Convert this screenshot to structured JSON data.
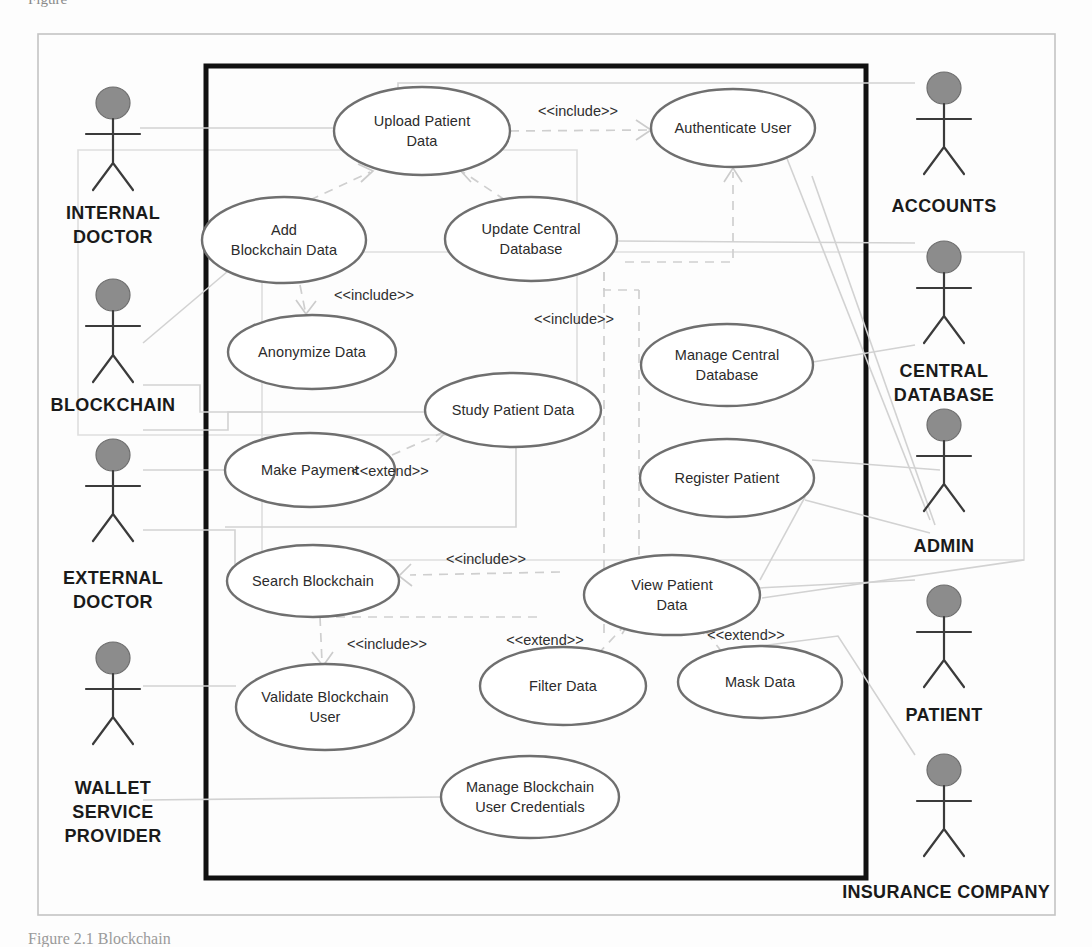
{
  "figure": {
    "caption_top_fragment": "Figure",
    "caption_bottom_fragment": "Figure 2.1 Blockchain",
    "system_boundary_label": "INSURANCE COMPANY"
  },
  "actors": [
    {
      "id": "internal-doctor",
      "label": "INTERNAL\nDOCTOR",
      "line1": "INTERNAL",
      "line2": "DOCTOR",
      "x": 113,
      "y": 118,
      "label_y": 218
    },
    {
      "id": "blockchain",
      "label": "BLOCKCHAIN",
      "line1": "BLOCKCHAIN",
      "line2": "",
      "x": 113,
      "y": 310,
      "label_y": 406
    },
    {
      "id": "external-doctor",
      "label": "EXTERNAL\nDOCTOR",
      "line1": "EXTERNAL",
      "line2": "DOCTOR",
      "x": 113,
      "y": 452,
      "label_y": 583
    },
    {
      "id": "wallet-service-provider",
      "label": "WALLET\nSERVICE\nPROVIDER",
      "line1": "WALLET",
      "line2": "SERVICE",
      "line3": "PROVIDER",
      "x": 113,
      "y": 673,
      "label_y": 794
    },
    {
      "id": "accounts",
      "label": "ACCOUNTS",
      "line1": "ACCOUNTS",
      "line2": "",
      "x": 944,
      "y": 90,
      "label_y": 183
    },
    {
      "id": "central-database",
      "label": "CENTRAL\nDATABASE",
      "line1": "CENTRAL",
      "line2": "DATABASE",
      "x": 944,
      "y": 258,
      "label_y": 355
    },
    {
      "id": "admin",
      "label": "ADMIN",
      "line1": "ADMIN",
      "line2": "",
      "x": 944,
      "y": 424,
      "label_y": 547
    },
    {
      "id": "patient",
      "label": "PATIENT",
      "line1": "PATIENT",
      "line2": "",
      "x": 944,
      "y": 607,
      "label_y": 712
    },
    {
      "id": "insurance-company-actor",
      "label": "",
      "line1": "",
      "line2": "",
      "x": 944,
      "y": 775,
      "label_y": 0
    }
  ],
  "use_cases": [
    {
      "id": "upload-patient-data",
      "line1": "Upload Patient",
      "line2": "Data",
      "cx": 422,
      "cy": 131,
      "rx": 88,
      "ry": 44
    },
    {
      "id": "authenticate-user",
      "line1": "Authenticate User",
      "line2": "",
      "cx": 733,
      "cy": 128,
      "rx": 82,
      "ry": 39
    },
    {
      "id": "add-blockchain-data",
      "line1": "Add",
      "line2": "Blockchain Data",
      "cx": 284,
      "cy": 240,
      "rx": 82,
      "ry": 43
    },
    {
      "id": "update-central-database",
      "line1": "Update Central",
      "line2": "Database",
      "cx": 531,
      "cy": 239,
      "rx": 86,
      "ry": 42
    },
    {
      "id": "anonymize-data",
      "line1": "Anonymize Data",
      "line2": "",
      "cx": 312,
      "cy": 352,
      "rx": 84,
      "ry": 37
    },
    {
      "id": "manage-central-database",
      "line1": "Manage Central",
      "line2": "Database",
      "cx": 727,
      "cy": 365,
      "rx": 86,
      "ry": 41
    },
    {
      "id": "study-patient-data",
      "line1": "Study Patient Data",
      "line2": "",
      "cx": 513,
      "cy": 410,
      "rx": 88,
      "ry": 37
    },
    {
      "id": "make-payment",
      "line1": "Make Payment",
      "line2": "",
      "cx": 310,
      "cy": 470,
      "rx": 85,
      "ry": 37
    },
    {
      "id": "register-patient",
      "line1": "Register Patient",
      "line2": "",
      "cx": 727,
      "cy": 478,
      "rx": 87,
      "ry": 39
    },
    {
      "id": "search-blockchain",
      "line1": "Search Blockchain",
      "line2": "",
      "cx": 313,
      "cy": 581,
      "rx": 86,
      "ry": 36
    },
    {
      "id": "view-patient-data",
      "line1": "View Patient",
      "line2": "Data",
      "cx": 672,
      "cy": 595,
      "rx": 88,
      "ry": 40
    },
    {
      "id": "validate-blockchain-user",
      "line1": "Validate Blockchain",
      "line2": "User",
      "cx": 325,
      "cy": 707,
      "rx": 89,
      "ry": 43
    },
    {
      "id": "filter-data",
      "line1": "Filter Data",
      "line2": "",
      "cx": 563,
      "cy": 686,
      "rx": 83,
      "ry": 39
    },
    {
      "id": "mask-data",
      "line1": "Mask Data",
      "line2": "",
      "cx": 760,
      "cy": 682,
      "rx": 82,
      "ry": 36
    },
    {
      "id": "manage-blockchain-user-credentials",
      "line1": "Manage Blockchain",
      "line2": "User Credentials",
      "cx": 530,
      "cy": 797,
      "rx": 89,
      "ry": 41
    }
  ],
  "stereotypes": [
    {
      "id": "include-upload-auth",
      "text": "<<include>>",
      "x": 578,
      "y": 112
    },
    {
      "id": "include-add-anonymize",
      "text": "<<include>>",
      "x": 374,
      "y": 296
    },
    {
      "id": "include-update-auth",
      "text": "<<include>>",
      "x": 574,
      "y": 320
    },
    {
      "id": "extend-make-study",
      "text": "<<extend>>",
      "x": 390,
      "y": 472
    },
    {
      "id": "include-search-study",
      "text": "<<include>>",
      "x": 486,
      "y": 560
    },
    {
      "id": "include-validate-search",
      "text": "<<include>>",
      "x": 387,
      "y": 645
    },
    {
      "id": "extend-filter-view",
      "text": "<<extend>>",
      "x": 545,
      "y": 641
    },
    {
      "id": "extend-mask-view",
      "text": "<<extend>>",
      "x": 746,
      "y": 636
    }
  ],
  "frames": {
    "outer": {
      "x": 38,
      "y": 34,
      "w": 1017,
      "h": 881
    },
    "system": {
      "x": 206,
      "y": 66,
      "w": 660,
      "h": 812
    },
    "group_blockchain": {
      "x": 78,
      "y": 150,
      "w": 499,
      "h": 285
    },
    "group_admin": {
      "x": 262,
      "y": 252,
      "w": 762,
      "h": 308
    }
  },
  "colors": {
    "actor_head_fill": "#8c8c8c",
    "ellipse_stroke": "#6f6f6f",
    "system_boundary_stroke": "#111111",
    "connector_stroke": "#d2d2d2",
    "text": "#2b2b2b"
  }
}
